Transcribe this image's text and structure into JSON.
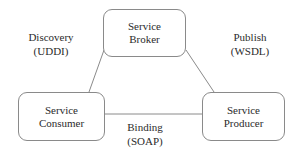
{
  "diagram": {
    "background_color": "#ffffff",
    "stroke_color": "#8a8a8a",
    "text_color": "#2b2b2b",
    "nodes": [
      {
        "id": "broker",
        "line1": "Service",
        "line2": "Broker"
      },
      {
        "id": "consumer",
        "line1": "Service",
        "line2": "Consumer"
      },
      {
        "id": "producer",
        "line1": "Service",
        "line2": "Producer"
      }
    ],
    "edges": [
      {
        "id": "discovery",
        "line1": "Discovery",
        "line2": "(UDDI)",
        "from": "consumer",
        "to": "broker"
      },
      {
        "id": "publish",
        "line1": "Publish",
        "line2": "(WSDL)",
        "from": "producer",
        "to": "broker"
      },
      {
        "id": "binding",
        "line1": "Binding",
        "line2": "(SOAP)",
        "from": "consumer",
        "to": "producer"
      }
    ]
  }
}
